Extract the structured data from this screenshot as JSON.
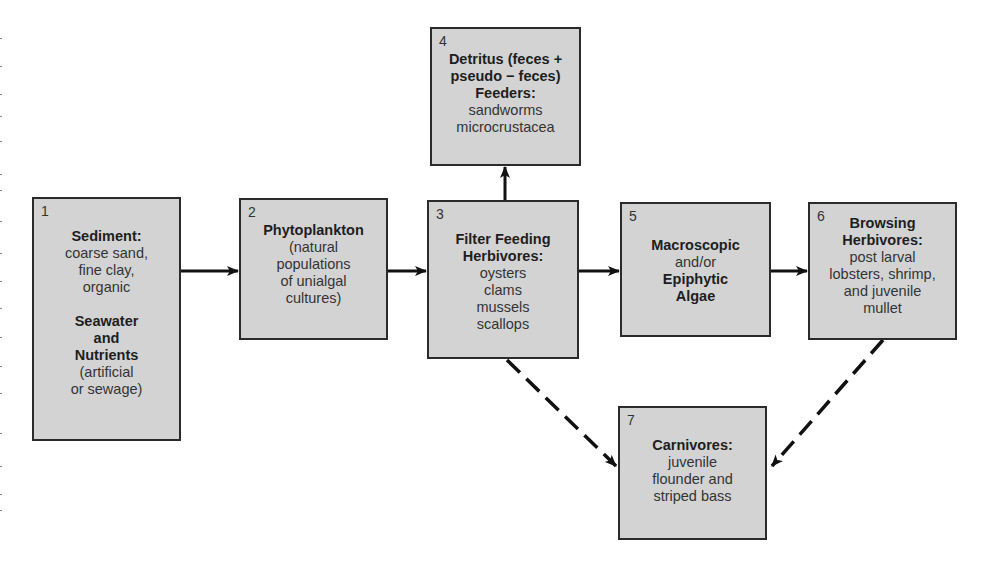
{
  "diagram": {
    "boxes": [
      {
        "number": "1",
        "lines": [
          {
            "text": "Sediment:",
            "bold": true
          },
          {
            "text": "coarse sand,",
            "bold": false
          },
          {
            "text": "fine clay,",
            "bold": false
          },
          {
            "text": "organic",
            "bold": false
          },
          {
            "text": "",
            "bold": false
          },
          {
            "text": "Seawater",
            "bold": true
          },
          {
            "text": "and",
            "bold": true
          },
          {
            "text": "Nutrients",
            "bold": true
          },
          {
            "text": "(artificial",
            "bold": false
          },
          {
            "text": "or sewage)",
            "bold": false
          }
        ]
      },
      {
        "number": "2",
        "lines": [
          {
            "text": "Phytoplankton",
            "bold": true
          },
          {
            "text": "(natural",
            "bold": false
          },
          {
            "text": "populations",
            "bold": false
          },
          {
            "text": "of unialgal",
            "bold": false
          },
          {
            "text": "cultures)",
            "bold": false
          }
        ]
      },
      {
        "number": "3",
        "lines": [
          {
            "text": "Filter Feeding",
            "bold": true
          },
          {
            "text": "Herbivores:",
            "bold": true
          },
          {
            "text": "oysters",
            "bold": false
          },
          {
            "text": "clams",
            "bold": false
          },
          {
            "text": "mussels",
            "bold": false
          },
          {
            "text": "scallops",
            "bold": false
          }
        ]
      },
      {
        "number": "4",
        "lines": [
          {
            "text": "Detritus (feces +",
            "bold": true
          },
          {
            "text": "pseudo − feces)",
            "bold": true
          },
          {
            "text": "Feeders:",
            "bold": true
          },
          {
            "text": "sandworms",
            "bold": false
          },
          {
            "text": "microcrustacea",
            "bold": false
          }
        ]
      },
      {
        "number": "5",
        "lines": [
          {
            "text": "Macroscopic",
            "bold": true
          },
          {
            "text": "and/or",
            "bold": false
          },
          {
            "text": "Epiphytic",
            "bold": true
          },
          {
            "text": "Algae",
            "bold": true
          }
        ]
      },
      {
        "number": "6",
        "lines": [
          {
            "text": "Browsing",
            "bold": true
          },
          {
            "text": "Herbivores:",
            "bold": true
          },
          {
            "text": "post larval",
            "bold": false
          },
          {
            "text": "lobsters, shrimp,",
            "bold": false
          },
          {
            "text": "and juvenile",
            "bold": false
          },
          {
            "text": "mullet",
            "bold": false
          }
        ]
      },
      {
        "number": "7",
        "lines": [
          {
            "text": "Carnivores:",
            "bold": true
          },
          {
            "text": "juvenile",
            "bold": false
          },
          {
            "text": "flounder and",
            "bold": false
          },
          {
            "text": "striped bass",
            "bold": false
          }
        ]
      }
    ],
    "edges": [
      {
        "from": "1",
        "to": "2",
        "style": "solid"
      },
      {
        "from": "2",
        "to": "3",
        "style": "solid"
      },
      {
        "from": "3",
        "to": "4",
        "style": "solid"
      },
      {
        "from": "3",
        "to": "5",
        "style": "solid"
      },
      {
        "from": "5",
        "to": "6",
        "style": "solid"
      },
      {
        "from": "3",
        "to": "7",
        "style": "dashed"
      },
      {
        "from": "6",
        "to": "7",
        "style": "dashed"
      }
    ],
    "colors": {
      "box_fill": "#d3d3d3",
      "box_border": "#2b2b2b",
      "arrow": "#111111"
    }
  }
}
